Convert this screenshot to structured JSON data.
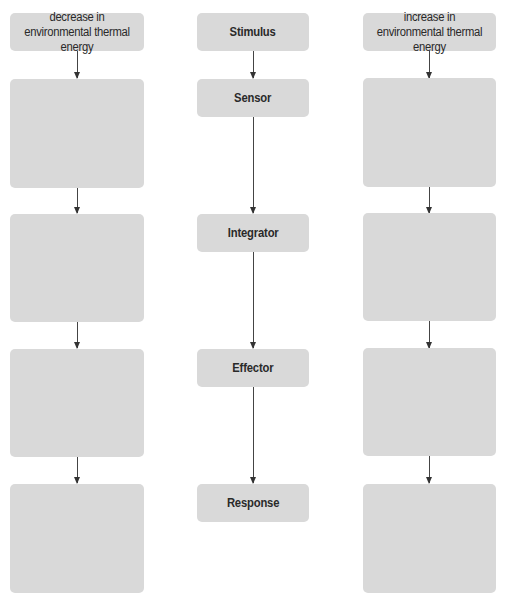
{
  "diagram": {
    "type": "flowchart",
    "colors": {
      "box_fill": "#d9d9d9",
      "arrow": "#333333",
      "text": "#2a2a2a",
      "background": "#ffffff"
    },
    "left_column": {
      "header": "decrease in environmental thermal energy",
      "boxes": [
        "",
        "",
        "",
        ""
      ]
    },
    "center_column": {
      "stages": [
        {
          "label": "Stimulus"
        },
        {
          "label": "Sensor"
        },
        {
          "label": "Integrator"
        },
        {
          "label": "Effector"
        },
        {
          "label": "Response"
        }
      ]
    },
    "right_column": {
      "header": "increase in environmental thermal energy",
      "boxes": [
        "",
        "",
        "",
        ""
      ]
    }
  }
}
